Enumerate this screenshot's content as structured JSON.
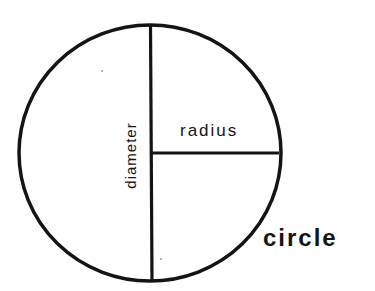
{
  "diagram": {
    "labels": {
      "radius": "radius",
      "diameter": "diameter",
      "circle": "circle"
    },
    "colors": {
      "stroke": "#141414",
      "background": "#ffffff"
    },
    "shape": {
      "center_x": 150,
      "center_y": 153,
      "radius_x": 131,
      "radius_y": 128,
      "stroke_width": 3.5
    }
  }
}
